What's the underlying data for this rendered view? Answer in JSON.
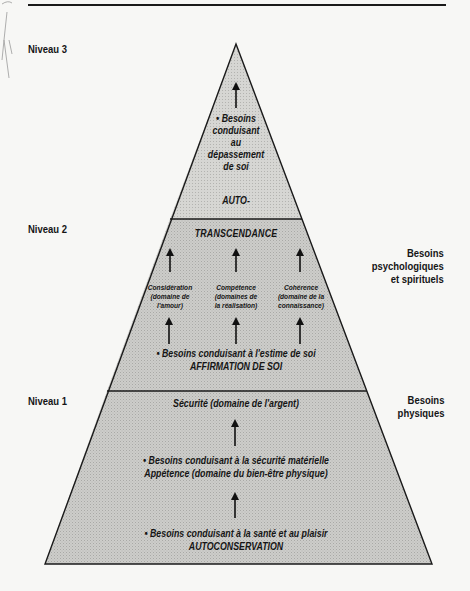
{
  "diagram": {
    "type": "pyramid",
    "colors": {
      "fill": "#c9c9c6",
      "fill_top": "#d2d2cf",
      "stroke": "#1a1a1a",
      "background": "#f7f7f5"
    },
    "left_labels": {
      "niveau3": "Niveau 3",
      "niveau2": "Niveau 2",
      "niveau1": "Niveau 1"
    },
    "right_labels": {
      "psycho": [
        "Besoins",
        "psychologiques",
        "et spirituels"
      ],
      "physiques": [
        "Besoins",
        "physiques"
      ]
    },
    "level3": {
      "bullet": "•",
      "lines": [
        "• Besoins",
        "conduisant",
        "au",
        "dépassement",
        "de soi"
      ],
      "footer": "AUTO-"
    },
    "level2": {
      "title": "TRANSCENDANCE",
      "columns": [
        {
          "lines": [
            "Considération",
            "(domaine de",
            "l'amour)"
          ]
        },
        {
          "lines": [
            "Compétence",
            "(domaines de",
            "la réalisation)"
          ]
        },
        {
          "lines": [
            "Cohérence",
            "(domaine de la",
            "connaissance)"
          ]
        }
      ],
      "need": "• Besoins conduisant à l'estime de soi",
      "name": "AFFIRMATION DE SOI"
    },
    "level1": {
      "title": "Sécurité (domaine de l'argent)",
      "need1": "• Besoins conduisant à la sécurité matérielle",
      "need1_sub": "Appétence (domaine du bien-être physique)",
      "need2": "• Besoins conduisant à la santé et au plaisir",
      "name": "AUTOCONSERVATION"
    }
  }
}
